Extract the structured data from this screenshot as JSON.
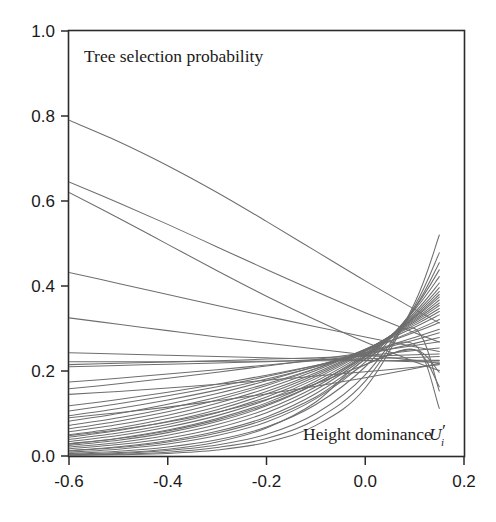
{
  "figure": {
    "background_color": "#ffffff",
    "line_color": "#6e6e6e",
    "axis_color": "#2b2b2b"
  },
  "labels": {
    "plot_title_inside": "Tree selection probability",
    "x_axis_annotation_main": "Height dominance",
    "x_axis_annotation_symbol": "U",
    "x_axis_annotation_prime": "′",
    "x_axis_annotation_subscript": "i"
  },
  "chart_data": {
    "type": "line",
    "title": "Tree selection probability",
    "xlabel": "Height dominance U'i",
    "ylabel": "",
    "xlim": [
      -0.6,
      0.2
    ],
    "ylim": [
      0.0,
      1.0
    ],
    "xticks": [
      -0.6,
      -0.4,
      -0.2,
      0.0,
      0.2
    ],
    "xticklabels": [
      "-0.6",
      "-0.4",
      "-0.2",
      "0.0",
      "0.2"
    ],
    "yticks": [
      0.0,
      0.2,
      0.4,
      0.6,
      0.8,
      1.0
    ],
    "yticklabels": [
      "0.0",
      "0.2",
      "0.4",
      "0.6",
      "0.8",
      "1.0"
    ],
    "grid": false,
    "legend": false,
    "data_x_range": [
      -0.6,
      0.15
    ],
    "x": [
      -0.6,
      -0.5,
      -0.4,
      -0.3,
      -0.2,
      -0.1,
      0.0,
      0.1,
      0.15
    ],
    "series": [
      {
        "name": "curve-01",
        "values": [
          0.79,
          0.74,
          0.683,
          0.62,
          0.552,
          0.482,
          0.412,
          0.345,
          0.313
        ]
      },
      {
        "name": "curve-02",
        "values": [
          0.645,
          0.596,
          0.545,
          0.492,
          0.439,
          0.387,
          0.337,
          0.29,
          0.268
        ]
      },
      {
        "name": "curve-03",
        "values": [
          0.62,
          0.56,
          0.498,
          0.436,
          0.376,
          0.32,
          0.268,
          0.222,
          0.201
        ]
      },
      {
        "name": "curve-04",
        "values": [
          0.432,
          0.406,
          0.38,
          0.354,
          0.329,
          0.304,
          0.28,
          0.257,
          0.246
        ]
      },
      {
        "name": "curve-05",
        "values": [
          0.325,
          0.31,
          0.295,
          0.28,
          0.266,
          0.252,
          0.238,
          0.225,
          0.218
        ]
      },
      {
        "name": "curve-06",
        "values": [
          0.243,
          0.24,
          0.237,
          0.234,
          0.231,
          0.228,
          0.225,
          0.222,
          0.221
        ]
      },
      {
        "name": "curve-07",
        "values": [
          0.222,
          0.222,
          0.222,
          0.223,
          0.223,
          0.224,
          0.224,
          0.225,
          0.225
        ]
      },
      {
        "name": "curve-08",
        "values": [
          0.21,
          0.213,
          0.216,
          0.219,
          0.222,
          0.226,
          0.229,
          0.232,
          0.234
        ]
      },
      {
        "name": "curve-09",
        "values": [
          0.174,
          0.183,
          0.193,
          0.203,
          0.214,
          0.225,
          0.236,
          0.248,
          0.254
        ]
      },
      {
        "name": "curve-10",
        "values": [
          0.158,
          0.17,
          0.183,
          0.197,
          0.212,
          0.227,
          0.243,
          0.26,
          0.269
        ]
      },
      {
        "name": "curve-11",
        "values": [
          0.118,
          0.133,
          0.15,
          0.169,
          0.19,
          0.213,
          0.238,
          0.265,
          0.279
        ]
      },
      {
        "name": "curve-12",
        "values": [
          0.106,
          0.123,
          0.142,
          0.163,
          0.187,
          0.213,
          0.242,
          0.273,
          0.29
        ]
      },
      {
        "name": "curve-13",
        "values": [
          0.095,
          0.112,
          0.132,
          0.155,
          0.181,
          0.21,
          0.243,
          0.279,
          0.298
        ]
      },
      {
        "name": "curve-14",
        "values": [
          0.082,
          0.1,
          0.122,
          0.147,
          0.177,
          0.211,
          0.249,
          0.291,
          0.314
        ]
      },
      {
        "name": "curve-15",
        "values": [
          0.072,
          0.09,
          0.112,
          0.138,
          0.17,
          0.206,
          0.248,
          0.295,
          0.321
        ]
      },
      {
        "name": "curve-16",
        "values": [
          0.064,
          0.082,
          0.104,
          0.132,
          0.166,
          0.205,
          0.251,
          0.303,
          0.332
        ]
      },
      {
        "name": "curve-17",
        "values": [
          0.057,
          0.074,
          0.096,
          0.124,
          0.159,
          0.201,
          0.251,
          0.308,
          0.34
        ]
      },
      {
        "name": "curve-18",
        "values": [
          0.05,
          0.066,
          0.088,
          0.116,
          0.152,
          0.196,
          0.25,
          0.312,
          0.347
        ]
      },
      {
        "name": "curve-19",
        "values": [
          0.044,
          0.06,
          0.081,
          0.109,
          0.146,
          0.192,
          0.249,
          0.316,
          0.354
        ]
      },
      {
        "name": "curve-20",
        "values": [
          0.039,
          0.054,
          0.074,
          0.102,
          0.139,
          0.187,
          0.247,
          0.319,
          0.36
        ]
      },
      {
        "name": "curve-21",
        "values": [
          0.034,
          0.048,
          0.068,
          0.095,
          0.132,
          0.182,
          0.245,
          0.322,
          0.367
        ]
      },
      {
        "name": "curve-22",
        "values": [
          0.029,
          0.042,
          0.061,
          0.088,
          0.125,
          0.176,
          0.242,
          0.325,
          0.374
        ]
      },
      {
        "name": "curve-23",
        "values": [
          0.025,
          0.037,
          0.055,
          0.081,
          0.118,
          0.17,
          0.239,
          0.327,
          0.38
        ]
      },
      {
        "name": "curve-24",
        "values": [
          0.021,
          0.032,
          0.049,
          0.074,
          0.11,
          0.163,
          0.236,
          0.33,
          0.387
        ]
      },
      {
        "name": "curve-25",
        "values": [
          0.017,
          0.027,
          0.042,
          0.066,
          0.102,
          0.156,
          0.233,
          0.334,
          0.396
        ]
      },
      {
        "name": "curve-26",
        "values": [
          0.013,
          0.022,
          0.036,
          0.058,
          0.092,
          0.147,
          0.228,
          0.338,
          0.407
        ]
      },
      {
        "name": "curve-27",
        "values": [
          0.009,
          0.016,
          0.028,
          0.048,
          0.08,
          0.135,
          0.221,
          0.344,
          0.422
        ]
      },
      {
        "name": "curve-28",
        "values": [
          0.006,
          0.011,
          0.021,
          0.038,
          0.068,
          0.121,
          0.21,
          0.348,
          0.438
        ]
      },
      {
        "name": "curve-29",
        "values": [
          0.003,
          0.006,
          0.013,
          0.026,
          0.051,
          0.1,
          0.191,
          0.348,
          0.455
        ]
      },
      {
        "name": "curve-30",
        "values": [
          0.002,
          0.004,
          0.009,
          0.02,
          0.041,
          0.086,
          0.176,
          0.353,
          0.478
        ]
      },
      {
        "name": "curve-31",
        "values": [
          0.001,
          0.003,
          0.006,
          0.014,
          0.032,
          0.072,
          0.16,
          0.36,
          0.52
        ]
      },
      {
        "name": "curve-32",
        "values": [
          0.145,
          0.152,
          0.16,
          0.169,
          0.178,
          0.188,
          0.198,
          0.209,
          0.215
        ]
      },
      {
        "name": "curve-33",
        "values": [
          0.09,
          0.102,
          0.115,
          0.13,
          0.146,
          0.164,
          0.184,
          0.206,
          0.218
        ]
      },
      {
        "name": "curve-34",
        "values": [
          0.215,
          0.218,
          0.221,
          0.224,
          0.228,
          0.231,
          0.235,
          0.238,
          0.24
        ]
      },
      {
        "name": "curve-35",
        "values": [
          0.004,
          0.008,
          0.016,
          0.033,
          0.066,
          0.127,
          0.228,
          0.262,
          0.112
        ]
      },
      {
        "name": "curve-36",
        "values": [
          0.028,
          0.041,
          0.059,
          0.085,
          0.121,
          0.17,
          0.234,
          0.3,
          0.153
        ]
      },
      {
        "name": "curve-37",
        "values": [
          0.012,
          0.02,
          0.033,
          0.054,
          0.087,
          0.139,
          0.215,
          0.25,
          0.197
        ]
      },
      {
        "name": "curve-38",
        "values": [
          0.048,
          0.062,
          0.08,
          0.103,
          0.133,
          0.17,
          0.215,
          0.25,
          0.163
        ]
      }
    ]
  }
}
